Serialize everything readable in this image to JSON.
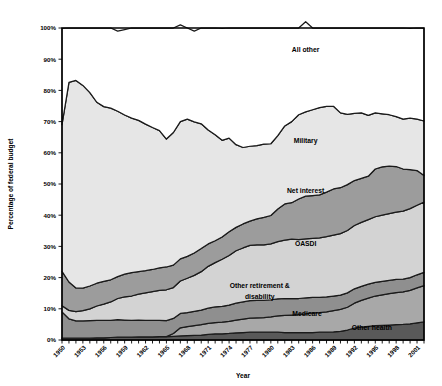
{
  "chart_data": {
    "type": "area",
    "stacked": true,
    "title": "",
    "xlabel": "Year",
    "ylabel": "Percentage of federal budget",
    "ylim": [
      0,
      100
    ],
    "ytick_labels": [
      "0%",
      "10%",
      "20%",
      "30%",
      "40%",
      "50%",
      "60%",
      "70%",
      "80%",
      "90%",
      "100%"
    ],
    "ytick_values": [
      0,
      10,
      20,
      30,
      40,
      50,
      60,
      70,
      80,
      90,
      100
    ],
    "xlim": [
      1950,
      2002
    ],
    "xtick_labels": [
      "1950",
      "1953",
      "1956",
      "1959",
      "1962",
      "1965",
      "1968",
      "1971",
      "1974",
      "1977",
      "1980",
      "1983",
      "1986",
      "1989",
      "1992",
      "1995",
      "1998",
      "2001"
    ],
    "xtick_values": [
      1950,
      1953,
      1956,
      1959,
      1962,
      1965,
      1968,
      1971,
      1974,
      1977,
      1980,
      1983,
      1986,
      1989,
      1992,
      1995,
      1998,
      2001
    ],
    "grid": false,
    "legend_position": "inline-annotations",
    "x": [
      1950,
      1951,
      1952,
      1953,
      1954,
      1955,
      1956,
      1957,
      1958,
      1959,
      1960,
      1961,
      1962,
      1963,
      1964,
      1965,
      1966,
      1967,
      1968,
      1969,
      1970,
      1971,
      1972,
      1973,
      1974,
      1975,
      1976,
      1977,
      1978,
      1979,
      1980,
      1981,
      1982,
      1983,
      1984,
      1985,
      1986,
      1987,
      1988,
      1989,
      1990,
      1991,
      1992,
      1993,
      1994,
      1995,
      1996,
      1997,
      1998,
      1999,
      2000,
      2001,
      2002
    ],
    "series": [
      {
        "name": "Other health",
        "fill": "#595959",
        "values": [
          0.6,
          0.6,
          0.6,
          0.6,
          0.6,
          0.7,
          0.7,
          0.8,
          0.9,
          0.9,
          0.9,
          1.0,
          1.0,
          1.0,
          1.1,
          1.1,
          1.2,
          1.3,
          1.4,
          1.5,
          1.6,
          1.8,
          2.0,
          2.0,
          2.1,
          2.3,
          2.4,
          2.5,
          2.5,
          2.5,
          2.5,
          2.5,
          2.4,
          2.4,
          2.4,
          2.4,
          2.4,
          2.5,
          2.5,
          2.6,
          2.8,
          3.2,
          3.8,
          4.1,
          4.4,
          4.6,
          4.7,
          4.8,
          4.9,
          5.0,
          5.2,
          5.5,
          5.8
        ]
      },
      {
        "name": "Medicare",
        "fill": "#a8a8a8",
        "values": [
          0.0,
          0.0,
          0.0,
          0.0,
          0.0,
          0.0,
          0.0,
          0.0,
          0.0,
          0.0,
          0.0,
          0.0,
          0.0,
          0.0,
          0.0,
          0.0,
          0.9,
          2.6,
          2.9,
          3.1,
          3.3,
          3.5,
          3.6,
          3.7,
          3.9,
          4.1,
          4.3,
          4.5,
          4.6,
          4.7,
          4.9,
          5.2,
          5.5,
          5.6,
          5.7,
          6.0,
          6.3,
          6.3,
          6.5,
          6.8,
          7.0,
          7.3,
          8.0,
          8.6,
          9.0,
          9.5,
          9.8,
          10.1,
          10.3,
          10.4,
          10.7,
          11.2,
          11.6
        ]
      },
      {
        "name": "Other retirement & disability",
        "fill": "#8f8f8f",
        "values": [
          8.4,
          6.2,
          5.5,
          5.5,
          5.6,
          5.6,
          5.6,
          5.5,
          5.6,
          5.5,
          5.4,
          5.4,
          5.3,
          5.3,
          5.2,
          5.1,
          4.8,
          4.6,
          4.5,
          4.6,
          4.7,
          4.9,
          5.0,
          5.1,
          5.2,
          5.4,
          5.5,
          5.6,
          5.6,
          5.5,
          5.5,
          5.5,
          5.4,
          5.3,
          5.2,
          5.1,
          5.0,
          4.9,
          4.8,
          4.7,
          4.6,
          4.6,
          4.6,
          4.5,
          4.5,
          4.4,
          4.3,
          4.2,
          4.2,
          4.1,
          4.1,
          4.2,
          4.3
        ]
      },
      {
        "name": "OASDI",
        "fill": "#d3d3d3",
        "values": [
          2.0,
          2.7,
          3.0,
          3.3,
          3.8,
          4.6,
          5.2,
          5.9,
          6.8,
          7.4,
          7.8,
          8.3,
          8.8,
          9.2,
          9.6,
          9.9,
          9.9,
          10.4,
          11.0,
          11.5,
          12.3,
          13.4,
          14.2,
          15.1,
          15.9,
          16.8,
          17.3,
          17.7,
          17.8,
          17.8,
          17.9,
          18.3,
          18.7,
          19.0,
          18.9,
          18.9,
          18.9,
          19.0,
          19.3,
          19.5,
          19.7,
          20.0,
          20.3,
          20.5,
          20.7,
          21.0,
          21.2,
          21.4,
          21.6,
          21.8,
          22.1,
          22.3,
          22.5
        ]
      },
      {
        "name": "Net interest",
        "fill": "#9c9c9c",
        "values": [
          11.0,
          9.1,
          7.6,
          7.2,
          7.3,
          7.3,
          7.3,
          7.1,
          7.0,
          7.3,
          7.5,
          7.2,
          7.1,
          7.1,
          7.2,
          7.3,
          7.2,
          7.1,
          7.0,
          7.2,
          7.4,
          7.2,
          7.0,
          7.1,
          7.6,
          7.5,
          7.7,
          7.8,
          8.3,
          8.8,
          9.1,
          10.5,
          11.6,
          11.7,
          13.0,
          13.7,
          13.7,
          13.8,
          14.3,
          14.8,
          14.7,
          14.7,
          14.4,
          14.1,
          13.9,
          15.3,
          15.5,
          15.2,
          14.6,
          13.5,
          12.5,
          11.1,
          8.5
        ]
      },
      {
        "name": "Military",
        "fill": "#e6e6e6",
        "values": [
          47.0,
          64.0,
          66.5,
          65.0,
          62.0,
          58.0,
          56.0,
          55.0,
          53.0,
          51.0,
          49.5,
          48.5,
          47.0,
          45.5,
          44.0,
          41.0,
          42.5,
          44.0,
          44.0,
          42.0,
          40.0,
          36.5,
          34.0,
          31.0,
          30.0,
          26.5,
          24.5,
          24.0,
          23.5,
          23.5,
          23.0,
          23.5,
          25.0,
          26.0,
          27.0,
          27.0,
          27.5,
          28.0,
          27.5,
          26.5,
          24.0,
          22.5,
          21.5,
          21.0,
          19.5,
          18.0,
          17.0,
          16.5,
          16.0,
          16.0,
          16.5,
          16.5,
          17.5
        ]
      },
      {
        "name": "All other",
        "fill": "#ffffff",
        "values": [
          30.9,
          17.4,
          16.8,
          18.4,
          20.7,
          23.8,
          25.2,
          25.7,
          25.7,
          27.4,
          28.9,
          29.6,
          30.8,
          31.9,
          32.9,
          35.6,
          33.5,
          31.0,
          29.2,
          29.1,
          30.7,
          32.7,
          34.2,
          35.9,
          35.3,
          37.4,
          38.3,
          37.9,
          37.7,
          37.2,
          37.1,
          34.5,
          31.4,
          30.0,
          27.8,
          28.9,
          26.2,
          25.5,
          25.1,
          25.1,
          27.2,
          27.7,
          27.4,
          27.2,
          28.0,
          27.2,
          27.5,
          27.8,
          28.4,
          29.2,
          28.8,
          29.2,
          29.8
        ]
      }
    ],
    "annotations": [
      {
        "text": "All other",
        "x": 1985,
        "y": 93
      },
      {
        "text": "Military",
        "x": 1985,
        "y": 64
      },
      {
        "text": "Net interest",
        "x": 1985,
        "y": 48
      },
      {
        "text": "OASDI",
        "x": 1985,
        "y": 31
      },
      {
        "text": "Other retirement &",
        "x": 1978.4,
        "y": 17.5
      },
      {
        "text": "disability",
        "x": 1978.4,
        "y": 14.0
      },
      {
        "text": "Medicare",
        "x": 1985.2,
        "y": 8.5
      },
      {
        "text": "Other health",
        "x": 1994.5,
        "y": 4.0
      }
    ]
  }
}
